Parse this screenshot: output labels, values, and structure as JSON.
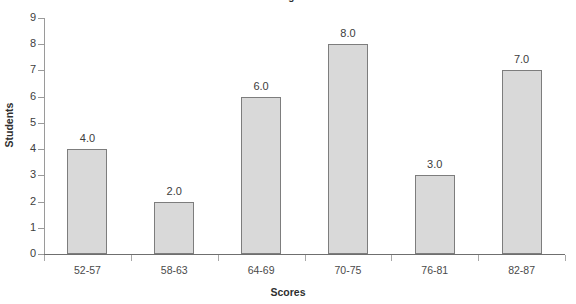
{
  "chart_data": {
    "type": "bar",
    "title": "Histogram",
    "xlabel": "Scores",
    "ylabel": "Students",
    "categories": [
      "52-57",
      "58-63",
      "64-69",
      "70-75",
      "76-81",
      "82-87"
    ],
    "values": [
      4,
      2,
      6,
      8,
      3,
      7
    ],
    "data_labels": [
      "4.0",
      "2.0",
      "6.0",
      "8.0",
      "3.0",
      "7.0"
    ],
    "ylim": [
      0,
      9
    ],
    "ytick_labels": [
      "9",
      "8",
      "7",
      "6",
      "5",
      "4",
      "3",
      "2",
      "1",
      "0"
    ],
    "ytick_values": [
      9,
      8,
      7,
      6,
      5,
      4,
      3,
      2,
      1,
      0
    ],
    "grid": false,
    "legend": false,
    "series": [
      {
        "name": "Students",
        "values": [
          4,
          2,
          6,
          8,
          3,
          7
        ]
      }
    ],
    "colors": {
      "bar_fill": "#d9d9d9",
      "bar_border": "#7d7d7d",
      "axis": "#6f6f6f",
      "text": "#3a3a3a",
      "background": "#ffffff"
    }
  }
}
